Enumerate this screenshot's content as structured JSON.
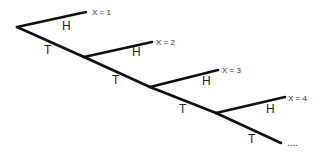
{
  "diagram": {
    "type": "probability-tree",
    "branch_labels": {
      "heads": "H",
      "tails": "T"
    },
    "stages": [
      {
        "node": [
          17,
          27
        ],
        "heads_end": [
          86,
          12
        ],
        "tails_end": [
          84,
          57
        ],
        "outcome": "X = 1",
        "h_label_pos": [
          62,
          30
        ],
        "t_label_pos": [
          44,
          54
        ],
        "outcome_pos": [
          92,
          15
        ]
      },
      {
        "node": [
          84,
          57
        ],
        "heads_end": [
          152,
          42
        ],
        "tails_end": [
          150,
          87
        ],
        "outcome": "X = 2",
        "h_label_pos": [
          132,
          56
        ],
        "t_label_pos": [
          112,
          84
        ],
        "outcome_pos": [
          156,
          45
        ]
      },
      {
        "node": [
          150,
          87
        ],
        "heads_end": [
          218,
          70
        ],
        "tails_end": [
          216,
          113
        ],
        "outcome": "X = 3",
        "h_label_pos": [
          202,
          85
        ],
        "t_label_pos": [
          179,
          113
        ],
        "outcome_pos": [
          222,
          73
        ]
      },
      {
        "node": [
          216,
          113
        ],
        "heads_end": [
          285,
          97
        ],
        "tails_end": [
          281,
          143
        ],
        "outcome": "X = 4",
        "h_label_pos": [
          266,
          113
        ],
        "t_label_pos": [
          248,
          143
        ],
        "outcome_pos": [
          288,
          101
        ]
      }
    ],
    "continuation": {
      "text": "....",
      "pos": [
        287,
        146
      ]
    },
    "colors": {
      "edge": "#111111",
      "text": "#222222"
    }
  }
}
